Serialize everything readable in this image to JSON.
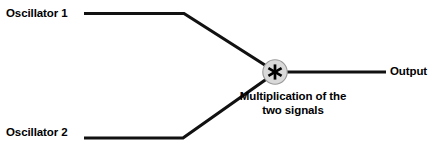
{
  "diagram": {
    "background_color": "#ffffff",
    "line_color": "#111111",
    "node_fill_color": "#d9d9d9",
    "node_edge_color": "#8c8c8c",
    "text_color": "#000000",
    "inputs": [
      {
        "id": "oscillator-1",
        "label": "Oscillator 1"
      },
      {
        "id": "oscillator-2",
        "label": "Oscillator 2"
      }
    ],
    "node": {
      "id": "multiply-node",
      "symbol": "*",
      "icon": "asterisk-icon",
      "caption_line_1": "Multiplication of the",
      "caption_line_2": "two signals"
    },
    "output": {
      "id": "output",
      "label": "Output"
    }
  }
}
